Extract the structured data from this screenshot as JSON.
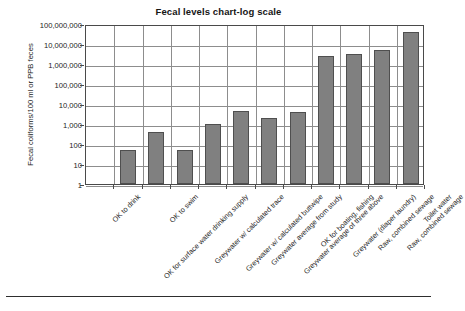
{
  "chart_data": {
    "type": "bar",
    "title": "Fecal levels chart-log scale",
    "xlabel": "",
    "ylabel": "Fecal coliforms/100 ml or PPB feces",
    "yscale": "log",
    "ylim": [
      1,
      100000000
    ],
    "grid": true,
    "legend": "none",
    "ytick_labels": [
      "100,000,000",
      "10,000,000",
      "1,000,000",
      "100,000",
      "10,000",
      "1,000",
      "100",
      "10",
      "1"
    ],
    "ytick_values": [
      100000000,
      10000000,
      1000000,
      100000,
      10000,
      1000,
      100,
      10,
      1
    ],
    "categories": [
      "OK to drink",
      "OK for surface water drinking supply",
      "OK to swim",
      "Greywater w/ calculated trace",
      "Greywater w/ calculated buttwipe",
      "Greywater average from study",
      "Greywater average of three above",
      "OK for boating, fishing",
      "Greywater (diaper laundry)",
      "Raw, combined sewage",
      "Raw, combined sewage",
      "Toilet water"
    ],
    "values": [
      0,
      50,
      400,
      50,
      1000,
      4500,
      1900,
      4000,
      2500000,
      3000000,
      5000000,
      40000000
    ],
    "bar_color": "#808080",
    "bar_edge_color": "#4f4f4f",
    "axis_color": "#4a4a4a",
    "grid_color": "#8d8d8d"
  }
}
